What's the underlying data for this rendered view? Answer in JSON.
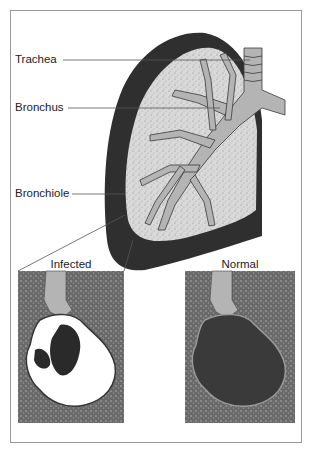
{
  "diagram": {
    "type": "anatomical-illustration",
    "labels": [
      {
        "text": "Trachea"
      },
      {
        "text": "Bronchus"
      },
      {
        "text": "Bronchiole"
      }
    ],
    "insets": [
      {
        "caption": "Infected"
      },
      {
        "caption": "Normal"
      }
    ],
    "colors": {
      "pleura": "#2f2f2f",
      "tissue": "#d8d8d8",
      "airway": "#b4b4b4",
      "inset_bg": "#6e6e6e",
      "alveoli_normal": "#3a3a3a",
      "alveoli_infected": "#ffffff",
      "frame": "#9a9a9a"
    }
  }
}
